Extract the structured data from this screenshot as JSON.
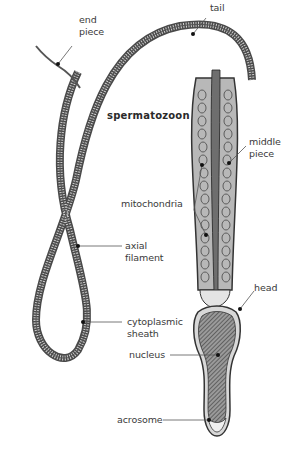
{
  "diagram": {
    "title": "spermatozoon",
    "labels": {
      "end_piece": "end\npiece",
      "tail": "tail",
      "middle_piece": "middle\npiece",
      "mitochondria": "mitochondria",
      "axial_filament": "axial\nfilament",
      "head": "head",
      "cytoplasmic_sheath": "cytoplasmic\nsheath",
      "nucleus": "nucleus",
      "acrosome": "acrosome"
    },
    "colors": {
      "ink": "#2f2f2f",
      "shade": "#8a8a8a",
      "light": "#d6d6d6",
      "label": "#3a3a3a"
    }
  }
}
